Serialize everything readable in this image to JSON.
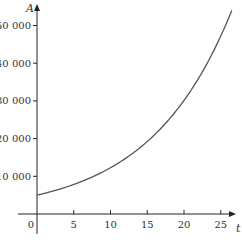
{
  "chart_data": {
    "type": "line",
    "title": "",
    "xlabel": "t",
    "ylabel": "A",
    "xlim": [
      -3,
      27.5
    ],
    "ylim": [
      -5000,
      55000
    ],
    "grid": false,
    "x_ticks": [
      "0",
      "5",
      "10",
      "15",
      "20",
      "25"
    ],
    "y_ticks": [
      "10 000",
      "20 000",
      "30 000",
      "40 000",
      "50 000"
    ],
    "series": [
      {
        "name": "A(t)",
        "x": [
          0,
          5,
          10,
          15,
          20,
          25,
          26.5
        ],
        "values": [
          5000,
          7850,
          12300,
          19300,
          30250,
          47450,
          54000
        ]
      }
    ],
    "colors": {
      "curve": "#555555",
      "axis": "#222222"
    }
  }
}
